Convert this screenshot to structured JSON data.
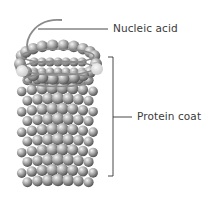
{
  "diagram": {
    "labels": {
      "nucleic_acid": "Nucleic acid",
      "protein_coat": "Protein coat"
    },
    "colors": {
      "background": "#ffffff",
      "sphere_light": "#f2f2f2",
      "sphere_mid": "#a8a8a8",
      "sphere_dark": "#5a5a5a",
      "highlight_sphere": "#d9d9d9",
      "leader_line": "#333333",
      "helix": "#8a8a8a",
      "label_text": "#3a3a3a"
    },
    "parts": [
      {
        "name": "nucleic-acid",
        "label": "Nucleic acid",
        "pointer": "leader line to helical strand emerging from top"
      },
      {
        "name": "protein-coat",
        "label": "Protein coat",
        "pointer": "bracket spanning cylinder of capsomere spheres"
      }
    ]
  }
}
